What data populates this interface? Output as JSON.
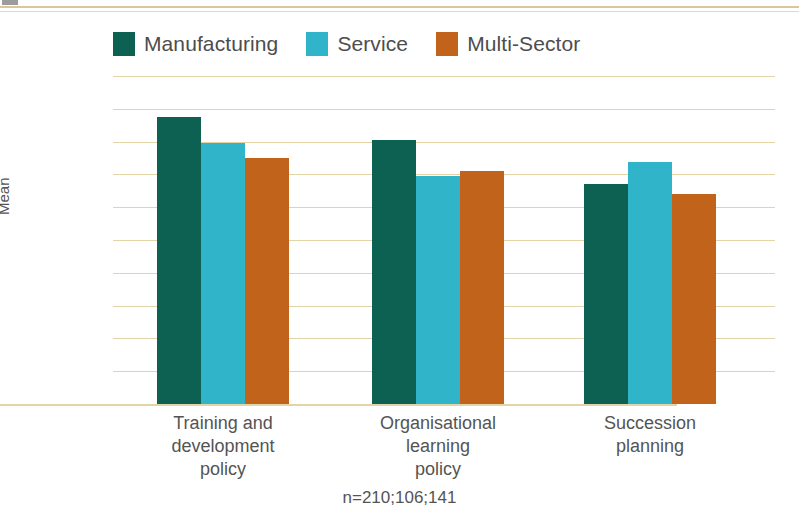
{
  "chart_data": {
    "type": "bar",
    "title": "",
    "xlabel": "",
    "ylabel": "Mean",
    "ylim": [
      0,
      5
    ],
    "ytick_labels": [
      "5%",
      "4.5%",
      "4%",
      "3.5%",
      "3%",
      "2.5%",
      "2%",
      "1.5%",
      "1%",
      "0.5%",
      "0%"
    ],
    "ytick_values": [
      5,
      4.5,
      4,
      3.5,
      3,
      2.5,
      2,
      1.5,
      1,
      0.5,
      0
    ],
    "grid": true,
    "legend_position": "top-left",
    "categories": [
      "Training and development policy",
      "Organisational learning policy",
      "Succession planning"
    ],
    "category_lines": [
      [
        "Training and",
        "development",
        "policy"
      ],
      [
        "Organisational",
        "learning",
        "policy"
      ],
      [
        "Succession",
        "planning"
      ]
    ],
    "series": [
      {
        "name": "Manufacturing",
        "color": "#0d6152",
        "values": [
          4.38,
          4.02,
          3.35
        ]
      },
      {
        "name": "Service",
        "color": "#2fb4ca",
        "values": [
          3.98,
          3.48,
          3.69
        ]
      },
      {
        "name": "Multi-Sector",
        "color": "#c1631b",
        "values": [
          3.75,
          3.55,
          3.2
        ]
      }
    ],
    "annotation": "n=210;106;141",
    "gridline_color": "#e3d4a8",
    "axis_text_color": "#545454"
  }
}
